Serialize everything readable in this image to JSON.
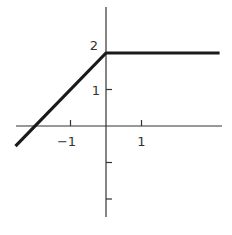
{
  "chart_data": {
    "type": "line",
    "title": "",
    "xlabel": "",
    "ylabel": "",
    "xlim": [
      -2.55,
      3.3
    ],
    "ylim": [
      -2.6,
      3.3
    ],
    "grid": false,
    "legend": null,
    "x_ticks": [
      -1,
      1
    ],
    "x_tick_labels": [
      "-1",
      "1"
    ],
    "y_ticks": [
      -2,
      -1,
      1,
      2
    ],
    "y_tick_labels": [
      "",
      "",
      "1",
      "2"
    ],
    "series": [
      {
        "name": "f(x)",
        "description": "f(x) = x + 2 for x <= 0; f(x) = 2 for x > 0",
        "x": [
          -2.55,
          0,
          3.2
        ],
        "y": [
          -0.55,
          2,
          2
        ],
        "color": "#1a1a1a"
      }
    ],
    "annotations": []
  },
  "colors": {
    "axis": "#333333",
    "line": "#1a1a1a",
    "background": "#ffffff"
  }
}
